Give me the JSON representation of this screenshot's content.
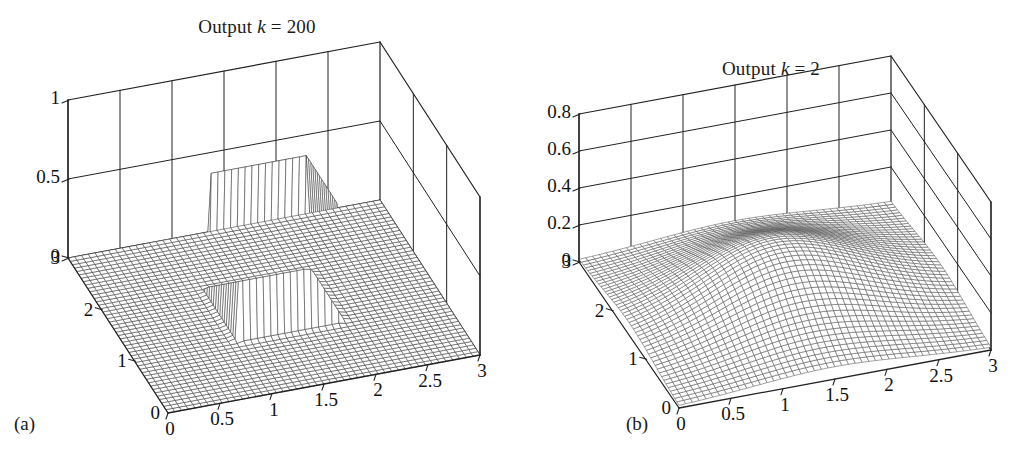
{
  "figure": {
    "background": "#ffffff",
    "ink": "#1a1a1a"
  },
  "panels": [
    {
      "id": "a",
      "caption": "(a)",
      "title_prefix": "Output ",
      "title_var": "k",
      "title_suffix": " = 200",
      "title_full": "Output k = 200"
    },
    {
      "id": "b",
      "caption": "(b)",
      "title_prefix": "Output ",
      "title_var": "k",
      "title_suffix": " = 2",
      "title_full": "Output k = 2"
    }
  ],
  "chart_data": [
    {
      "type": "surface",
      "panel": "a",
      "caption": "(a)",
      "title": "Output k = 200",
      "parameter": {
        "name": "k",
        "value": 200
      },
      "xlabel": "",
      "ylabel": "",
      "zlabel": "",
      "xlim": [
        0,
        3
      ],
      "ylim": [
        0,
        3
      ],
      "zlim": [
        0,
        1
      ],
      "xticks": [
        0,
        0.5,
        1,
        1.5,
        2,
        2.5,
        3
      ],
      "xticklabels": [
        "0",
        "0.5",
        "1",
        "1.5",
        "2",
        "2.5",
        "3"
      ],
      "yticks": [
        0,
        1,
        2,
        3
      ],
      "yticklabels": [
        "0",
        "1",
        "2",
        "3"
      ],
      "zticks": [
        0,
        0.5,
        1
      ],
      "zticklabels": [
        "0",
        "0.5",
        "1"
      ],
      "grid": true,
      "mesh": {
        "nx": 46,
        "ny": 46,
        "color": "#3a3a3a",
        "facecolor": "#ffffff"
      },
      "view": {
        "azimuth": -37.5,
        "elevation": 30
      },
      "surface_description": "Sharp-edged square plateau (mesa) with near-vertical walls rising from a flat zero baseline",
      "plateau": {
        "x_range": [
          1.0,
          2.0
        ],
        "y_range": [
          1.0,
          2.0
        ],
        "height": 0.75,
        "baseline": 0.0
      },
      "peak_value": 0.75,
      "series": [
        {
          "name": "output",
          "model": "logistic-step",
          "steepness": 200,
          "center_x": 1.5,
          "center_y": 1.5,
          "half_width": 0.5,
          "amplitude": 0.75
        }
      ]
    },
    {
      "type": "surface",
      "panel": "b",
      "caption": "(b)",
      "title": "Output k = 2",
      "parameter": {
        "name": "k",
        "value": 2
      },
      "xlabel": "",
      "ylabel": "",
      "zlabel": "",
      "xlim": [
        0,
        3
      ],
      "ylim": [
        0,
        3
      ],
      "zlim": [
        0,
        0.8
      ],
      "xticks": [
        0,
        0.5,
        1,
        1.5,
        2,
        2.5,
        3
      ],
      "xticklabels": [
        "0",
        "0.5",
        "1",
        "1.5",
        "2",
        "2.5",
        "3"
      ],
      "yticks": [
        0,
        1,
        2,
        3
      ],
      "yticklabels": [
        "0",
        "1",
        "2",
        "3"
      ],
      "zticks": [
        0,
        0.2,
        0.4,
        0.6,
        0.8
      ],
      "zticklabels": [
        "0",
        "0.2",
        "0.4",
        "0.6",
        "0.8"
      ],
      "grid": true,
      "mesh": {
        "nx": 46,
        "ny": 46,
        "color": "#555555",
        "facecolor": "#ffffff"
      },
      "view": {
        "azimuth": -37.5,
        "elevation": 30
      },
      "surface_description": "Smooth rounded Gaussian-like hill with soft shoulders, rising gently from a near-flat base",
      "peak": {
        "x": 1.35,
        "y": 1.5,
        "height": 0.3
      },
      "peak_value": 0.3,
      "series": [
        {
          "name": "output",
          "model": "logistic-step",
          "steepness": 2,
          "center_x": 1.5,
          "center_y": 1.5,
          "half_width": 0.5,
          "amplitude": 0.3
        }
      ]
    }
  ]
}
